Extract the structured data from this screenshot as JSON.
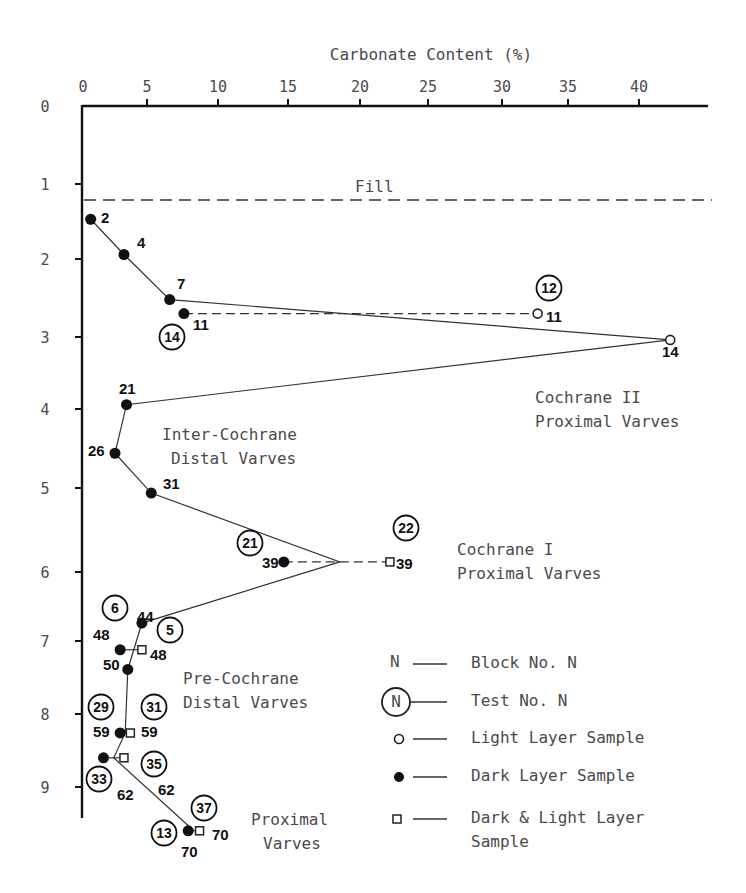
{
  "chart_data": {
    "type": "line",
    "title": "Carbonate Content (%)",
    "xlabel": "Carbonate Content (%)",
    "ylabel": "",
    "x_axis_position": "top",
    "xlim": [
      0,
      45
    ],
    "ylim": [
      0,
      9.4
    ],
    "y_inverted": true,
    "grid": false,
    "x_ticks": [
      0,
      5,
      10,
      15,
      20,
      25,
      30,
      35,
      40
    ],
    "y_ticks": [
      0,
      1,
      2,
      3,
      4,
      5,
      6,
      7,
      8,
      9
    ],
    "fill_line": {
      "depth": 1.24,
      "label": "Fill"
    },
    "series": [
      {
        "name": "Main profile (mean)",
        "style": "solid",
        "points": [
          {
            "block": "2",
            "x": 0.6,
            "y": 1.47
          },
          {
            "block": "4",
            "x": 3.2,
            "y": 1.94
          },
          {
            "block": "7",
            "x": 6.6,
            "y": 2.52
          },
          {
            "block": "14",
            "x": 42.2,
            "y": 3.04
          },
          {
            "block": "21",
            "x": 3.4,
            "y": 3.94
          },
          {
            "block": "26",
            "x": 2.5,
            "y": 4.56
          },
          {
            "block": "31",
            "x": 5.3,
            "y": 5.06
          },
          {
            "block": "39",
            "x": 18.6,
            "y": 5.88
          },
          {
            "block": "44",
            "x": 4.6,
            "y": 6.74
          },
          {
            "block": "50",
            "x": 3.5,
            "y": 7.39
          },
          {
            "block": "59",
            "x": 3.3,
            "y": 8.26
          },
          {
            "block": "62",
            "x": 2.4,
            "y": 8.6
          },
          {
            "block": "70",
            "x": 8.3,
            "y": 9.6
          }
        ]
      },
      {
        "name": "Dark Layer Sample",
        "marker": "filled-circle",
        "points": [
          {
            "block": "2",
            "x": 0.6,
            "y": 1.47
          },
          {
            "block": "4",
            "x": 3.2,
            "y": 1.94
          },
          {
            "block": "7",
            "x": 6.6,
            "y": 2.52
          },
          {
            "block": "11",
            "x": 7.6,
            "y": 2.7,
            "test": "14"
          },
          {
            "block": "21",
            "x": 3.4,
            "y": 3.94
          },
          {
            "block": "26",
            "x": 2.5,
            "y": 4.56
          },
          {
            "block": "31",
            "x": 5.3,
            "y": 5.06
          },
          {
            "block": "39",
            "x": 14.7,
            "y": 5.88,
            "test": "21"
          },
          {
            "block": "44",
            "x": 4.6,
            "y": 6.74,
            "test": "6"
          },
          {
            "block": "48",
            "x": 2.9,
            "y": 7.12
          },
          {
            "block": "50",
            "x": 3.5,
            "y": 7.39
          },
          {
            "block": "59",
            "x": 2.9,
            "y": 8.26,
            "test": "29"
          },
          {
            "block": "62",
            "x": 1.6,
            "y": 8.6,
            "test": "33"
          },
          {
            "block": "70",
            "x": 7.9,
            "y": 9.6,
            "test": "13"
          }
        ]
      },
      {
        "name": "Light Layer Sample",
        "marker": "open-circle",
        "points": [
          {
            "block": "11",
            "x": 32.7,
            "y": 2.7,
            "test": "12"
          },
          {
            "block": "14",
            "x": 42.2,
            "y": 3.04
          }
        ]
      },
      {
        "name": "Dark & Light Layer Sample",
        "marker": "open-square",
        "points": [
          {
            "block": "39",
            "x": 22.2,
            "y": 5.88,
            "test": "22"
          },
          {
            "block": "48",
            "x": 4.6,
            "y": 7.12,
            "test": "5"
          },
          {
            "block": "59",
            "x": 3.7,
            "y": 8.26,
            "test": "31"
          },
          {
            "block": "62",
            "x": 3.2,
            "y": 8.6,
            "test": "35"
          },
          {
            "block": "70",
            "x": 8.7,
            "y": 9.6,
            "test": "37"
          }
        ]
      }
    ],
    "annotations": [
      "Fill",
      "Cochrane II Proximal Varves",
      "Inter-Cochrane Distal Varves",
      "Cochrane I Proximal Varves",
      "Pre-Cochrane Distal Varves",
      "Proximal Varves"
    ],
    "legend": [
      {
        "symbol": "N",
        "label": "Block No. N"
      },
      {
        "symbol": "circled-N",
        "label": "Test No. N"
      },
      {
        "symbol": "open-circle",
        "label": "Light Layer Sample"
      },
      {
        "symbol": "filled-circle",
        "label": "Dark Layer Sample"
      },
      {
        "symbol": "open-square",
        "label": "Dark & Light Layer Sample"
      }
    ],
    "legend_position": "bottom-right"
  },
  "labels": {
    "title": "Carbonate Content (%)",
    "fill": "Fill",
    "cochrane2_l1": "Cochrane II",
    "cochrane2_l2": "Proximal Varves",
    "inter_l1": "Inter-Cochrane",
    "inter_l2": "Distal Varves",
    "cochrane1_l1": "Cochrane I",
    "cochrane1_l2": "Proximal Varves",
    "pre_l1": "Pre-Cochrane",
    "pre_l2": "Distal Varves",
    "prox_l1": "Proximal",
    "prox_l2": "Varves"
  },
  "legend": {
    "n_symbol": "N",
    "block": "Block No. N",
    "test": "Test No. N",
    "light": "Light Layer Sample",
    "dark": "Dark Layer Sample",
    "dl_l1": "Dark & Light Layer",
    "dl_l2": "Sample"
  },
  "block_labels": [
    {
      "text": "2",
      "x": 101,
      "y": 223
    },
    {
      "text": "4",
      "x": 137,
      "y": 248
    },
    {
      "text": "7",
      "x": 177,
      "y": 289
    },
    {
      "text": "11",
      "x": 193,
      "y": 330
    },
    {
      "text": "11",
      "x": 546,
      "y": 322
    },
    {
      "text": "14",
      "x": 662,
      "y": 357
    },
    {
      "text": "21",
      "x": 119,
      "y": 394
    },
    {
      "text": "26",
      "x": 88,
      "y": 456
    },
    {
      "text": "31",
      "x": 163,
      "y": 489
    },
    {
      "text": "39",
      "x": 262,
      "y": 568
    },
    {
      "text": "39",
      "x": 396,
      "y": 569
    },
    {
      "text": "44",
      "x": 137,
      "y": 636,
      "dy": -14
    },
    {
      "text": "48",
      "x": 93,
      "y": 640
    },
    {
      "text": "48",
      "x": 150,
      "y": 660
    },
    {
      "text": "50",
      "x": 103,
      "y": 670
    },
    {
      "text": "59",
      "x": 93,
      "y": 737
    },
    {
      "text": "59",
      "x": 141,
      "y": 737
    },
    {
      "text": "62",
      "x": 117,
      "y": 800
    },
    {
      "text": "62",
      "x": 158,
      "y": 795
    },
    {
      "text": "70",
      "x": 181,
      "y": 857
    },
    {
      "text": "70",
      "x": 212,
      "y": 840
    }
  ],
  "test_circles": [
    {
      "text": "12",
      "x": 549,
      "y": 288
    },
    {
      "text": "14",
      "x": 172,
      "y": 337
    },
    {
      "text": "21",
      "x": 250,
      "y": 543
    },
    {
      "text": "22",
      "x": 406,
      "y": 528
    },
    {
      "text": "6",
      "x": 115,
      "y": 608
    },
    {
      "text": "5",
      "x": 170,
      "y": 630
    },
    {
      "text": "29",
      "x": 101,
      "y": 707
    },
    {
      "text": "31",
      "x": 154,
      "y": 707
    },
    {
      "text": "35",
      "x": 154,
      "y": 764
    },
    {
      "text": "33",
      "x": 99,
      "y": 779
    },
    {
      "text": "37",
      "x": 204,
      "y": 808
    },
    {
      "text": "13",
      "x": 164,
      "y": 833
    }
  ]
}
